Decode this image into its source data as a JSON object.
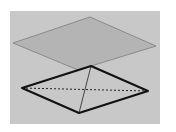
{
  "diagram": {
    "canvas": {
      "width": 176,
      "height": 132
    },
    "background_box": {
      "x": 10,
      "y": 11,
      "width": 150,
      "height": 113,
      "fill": "#c8c8c8"
    },
    "plane": {
      "points": [
        [
          90,
          17
        ],
        [
          156,
          46
        ],
        [
          78,
          70
        ],
        [
          13,
          43
        ]
      ],
      "fill": "#b4b4b4",
      "stroke": "#8a8a8a",
      "stroke_width": 1
    },
    "pyramid": {
      "apex": [
        91,
        66
      ],
      "base": {
        "left": [
          22,
          88
        ],
        "bottom": [
          79,
          113
        ],
        "right": [
          148,
          91
        ]
      },
      "visible_edges": [
        {
          "from": [
            91,
            66
          ],
          "to": [
            22,
            88
          ]
        },
        {
          "from": [
            22,
            88
          ],
          "to": [
            79,
            113
          ]
        },
        {
          "from": [
            79,
            113
          ],
          "to": [
            148,
            91
          ]
        },
        {
          "from": [
            148,
            91
          ],
          "to": [
            91,
            66
          ]
        }
      ],
      "inner_solid_edge": {
        "from": [
          91,
          66
        ],
        "to": [
          79,
          113
        ]
      },
      "hidden_dashed_edge": {
        "from": [
          22,
          88
        ],
        "to": [
          148,
          91
        ]
      },
      "edge_color": "#111111",
      "edge_width": 2,
      "inner_edge_width": 0.8
    }
  }
}
